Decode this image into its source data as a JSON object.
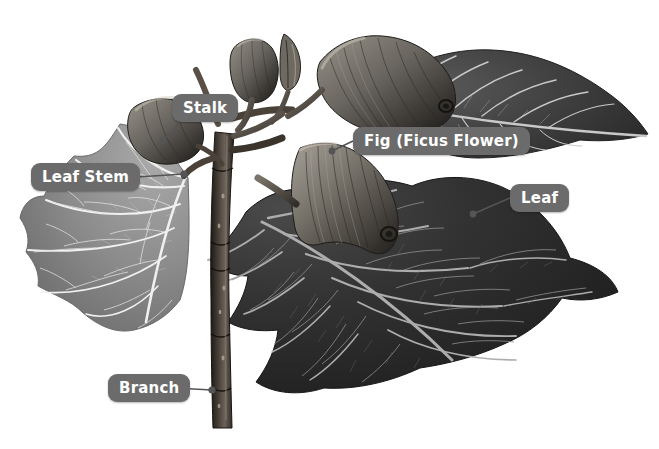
{
  "illustration": {
    "title": "Fig branch botanical illustration",
    "subject": "Ficus branch with figs and leaves",
    "style": "grayscale engraving",
    "background_color": "#ffffff",
    "label_background_color": "#6b6b6b",
    "label_text_color": "#ffffff",
    "leader_line_color": "#555555",
    "palette": {
      "leaf_light": "#8a8a8a",
      "leaf_dark": "#2b2b2b",
      "leaf_mid": "#4a4a4a",
      "vein_light": "#f2f2f2",
      "vein_dark": "#9a9a9a",
      "branch": "#3a332e",
      "fig_body": "#6e6a63",
      "fig_shadow": "#2f2c28"
    }
  },
  "labels": [
    {
      "id": "stalk",
      "text": "Stalk",
      "x": 172,
      "y": 94,
      "leader": {
        "x1": 180,
        "y1": 122,
        "x2": 160,
        "y2": 140
      }
    },
    {
      "id": "fig",
      "text": "Fig (Ficus Flower)",
      "x": 353,
      "y": 127,
      "leader": {
        "x1": 353,
        "y1": 141,
        "x2": 330,
        "y2": 150
      }
    },
    {
      "id": "leafstem",
      "text": "Leaf Stem",
      "x": 31,
      "y": 163,
      "leader": {
        "x1": 137,
        "y1": 177,
        "x2": 185,
        "y2": 174
      }
    },
    {
      "id": "leaf",
      "text": "Leaf",
      "x": 510,
      "y": 184,
      "leader": {
        "x1": 510,
        "y1": 198,
        "x2": 472,
        "y2": 214
      }
    },
    {
      "id": "branch",
      "text": "Branch",
      "x": 108,
      "y": 374,
      "leader": {
        "x1": 175,
        "y1": 388,
        "x2": 213,
        "y2": 390
      }
    }
  ],
  "parts": [
    {
      "name": "left-leaf",
      "description": "large light-gray lobed fig leaf on the left with pale radiating veins"
    },
    {
      "name": "right-leaf",
      "description": "large dark fig leaf lower right with light veins and serrated margin"
    },
    {
      "name": "upper-right-leaf",
      "description": "elongated dark leaf pointing to the upper right"
    },
    {
      "name": "main-fig",
      "description": "large pear-shaped ribbed fig in the center"
    },
    {
      "name": "top-fig",
      "description": "large fig at the top of the branch"
    },
    {
      "name": "small-fig",
      "description": "small young fig near the apex"
    },
    {
      "name": "bud",
      "description": "pointed terminal bud at the apex"
    },
    {
      "name": "branch",
      "description": "dark woody vertical branch with nodes and lenticels"
    }
  ]
}
